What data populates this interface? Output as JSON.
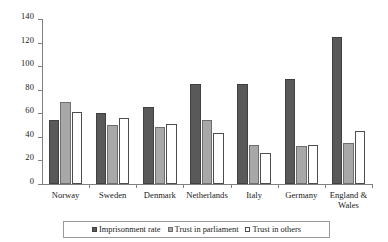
{
  "chart_data": {
    "type": "bar",
    "title": "",
    "subtitle": "",
    "xlabel": "",
    "ylabel": "",
    "ylim": [
      0,
      140
    ],
    "yticks": [
      0,
      20,
      40,
      60,
      80,
      100,
      120,
      140
    ],
    "grid": false,
    "legend_position": "bottom",
    "categories": [
      "Norway",
      "Sweden",
      "Denmark",
      "Netherlands",
      "Italy",
      "Germany",
      "England & Wales"
    ],
    "series": [
      {
        "name": "Imprisonment rate",
        "color": "#595959",
        "values": [
          54,
          60,
          65,
          85,
          85,
          89,
          125
        ]
      },
      {
        "name": "Trust in parliament",
        "color": "#a8a8a8",
        "values": [
          70,
          50,
          48,
          54,
          33,
          32,
          35
        ]
      },
      {
        "name": "Trust in others",
        "color": "#ffffff",
        "values": [
          61,
          56,
          51,
          43,
          26,
          33,
          45
        ]
      }
    ]
  },
  "legend": {
    "items": [
      {
        "label": "Imprisonment rate"
      },
      {
        "label": "Trust in parliament"
      },
      {
        "label": "Trust in others"
      }
    ]
  }
}
